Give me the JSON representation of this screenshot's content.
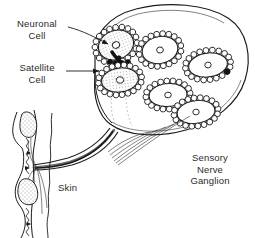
{
  "figure": {
    "type": "biological-line-diagram",
    "background_color": "#ffffff",
    "ink_color": "#1a1a1a",
    "shade_color": "#d8d6d2"
  },
  "labels": {
    "neuronal_cell": "Neuronal\nCell",
    "satellite_cell": "Satellite\nCell",
    "skin": "Skin",
    "ganglion": "Sensory\nNerve\nGanglion"
  },
  "structures": {
    "ganglion_outline": "large ovoid capsule occupying upper right of the figure",
    "neuron_count": 6,
    "neurons": [
      {
        "name": "neuron-1",
        "cx": 116,
        "cy": 45,
        "rx": 19,
        "ry": 15,
        "rot": -22,
        "satellites": 17,
        "nucleus_r": 3.4,
        "shaded": true
      },
      {
        "name": "neuron-2",
        "cx": 120,
        "cy": 80,
        "rx": 20,
        "ry": 13,
        "rot": -8,
        "satellites": 17,
        "nucleus_r": 3.4,
        "shaded": true
      },
      {
        "name": "neuron-3",
        "cx": 160,
        "cy": 50,
        "rx": 20,
        "ry": 16,
        "rot": -12,
        "satellites": 18,
        "nucleus_r": 3.2,
        "shaded": false
      },
      {
        "name": "neuron-4",
        "cx": 208,
        "cy": 65,
        "rx": 22,
        "ry": 14,
        "rot": -8,
        "satellites": 19,
        "nucleus_r": 3.0,
        "shaded": false
      },
      {
        "name": "neuron-5",
        "cx": 168,
        "cy": 95,
        "rx": 21,
        "ry": 13,
        "rot": -5,
        "satellites": 18,
        "nucleus_r": 3.2,
        "shaded": false
      },
      {
        "name": "neuron-6",
        "cx": 196,
        "cy": 112,
        "rx": 21,
        "ry": 13,
        "rot": -8,
        "satellites": 18,
        "nucleus_r": 3.0,
        "shaded": false
      }
    ],
    "nerve_bundle": "axon bundle fans out of the ganglion's lower-left pole and runs down-left to the skin",
    "skin_strip": "vertical epidermal strip at far left with two stippled sensory receptor corpuscles"
  },
  "pointers": {
    "neuronal_cell_arrow": "from label at upper left to the nucleus of neuron-1",
    "satellite_cell_arrow": "from label at mid left to the satellite cell ring of neuron-2"
  }
}
